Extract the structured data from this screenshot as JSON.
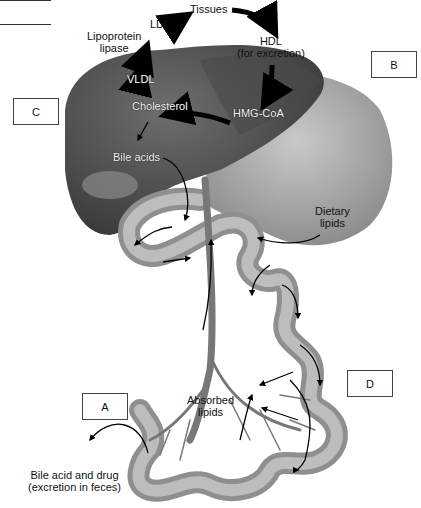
{
  "diagram": {
    "type": "anatomical-flow",
    "nodes": [
      {
        "id": "tissues",
        "label": "Tissues"
      },
      {
        "id": "ldl",
        "label": "LDL"
      },
      {
        "id": "lipoprotein_lipase",
        "label_line1": "Lipoprotein",
        "label_line2": "lipase"
      },
      {
        "id": "hdl",
        "label_line1": "HDL",
        "label_line2": "(for excretion)"
      },
      {
        "id": "vldl",
        "label": "VLDL"
      },
      {
        "id": "cholesterol",
        "label": "Cholesterol"
      },
      {
        "id": "hmg_coa",
        "label": "HMG-CoA"
      },
      {
        "id": "bile_acids",
        "label": "Bile acids"
      },
      {
        "id": "dietary_lipids",
        "label_line1": "Dietary",
        "label_line2": "lipids"
      },
      {
        "id": "absorbed_lipids",
        "label_line1": "Absorbed",
        "label_line2": "lipids"
      },
      {
        "id": "excretion",
        "label_line1": "Bile acid and drug",
        "label_line2": "(excretion in feces)"
      }
    ],
    "edges": [
      {
        "from": "cholesterol",
        "to": "vldl"
      },
      {
        "from": "vldl",
        "to": "ldl"
      },
      {
        "from": "ldl",
        "to": "tissues"
      },
      {
        "from": "tissues",
        "to": "hdl"
      },
      {
        "from": "hdl",
        "to": "hmg_coa"
      },
      {
        "from": "hmg_coa",
        "to": "cholesterol"
      },
      {
        "from": "cholesterol",
        "to": "bile_acids"
      },
      {
        "from": "bile_acids",
        "to": "intestine"
      },
      {
        "from": "dietary_lipids",
        "to": "intestine"
      },
      {
        "from": "intestine",
        "to": "absorbed_lipids"
      },
      {
        "from": "absorbed_lipids",
        "to": "liver"
      },
      {
        "from": "intestine",
        "to": "excretion"
      }
    ],
    "answer_boxes": [
      {
        "id": "A",
        "label": "A"
      },
      {
        "id": "B",
        "label": "B"
      },
      {
        "id": "C",
        "label": "C"
      },
      {
        "id": "D",
        "label": "D"
      }
    ]
  },
  "colors": {
    "liver": "#5a5a5a",
    "liver_dark": "#3c3c3c",
    "gut": "#9a9a9a",
    "gut_light": "#c8c8c8",
    "arrow": "#000000",
    "background": "#ffffff"
  }
}
